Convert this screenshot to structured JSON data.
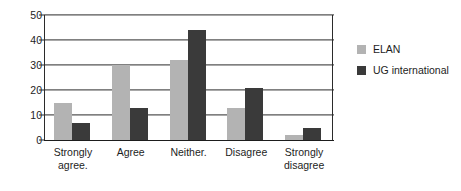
{
  "chart_data": {
    "type": "bar",
    "title": "",
    "xlabel": "",
    "ylabel": "",
    "categories": [
      "Strongly agree.",
      "Agree",
      "Neither.",
      "Disagree",
      "Strongly disagree"
    ],
    "series": [
      {
        "name": "ELAN",
        "color": "#b3b3b3",
        "values": [
          15,
          30,
          32,
          13,
          2
        ]
      },
      {
        "name": "UG international",
        "color": "#3a3a3a",
        "values": [
          7,
          13,
          44,
          21,
          5
        ]
      }
    ],
    "ylim": [
      0,
      50
    ],
    "yticks": [
      0,
      10,
      20,
      30,
      40,
      50
    ],
    "ytick_labels": [
      "0",
      "10",
      "20",
      "30",
      "40",
      "50"
    ],
    "grid": true,
    "legend_position": "right"
  }
}
